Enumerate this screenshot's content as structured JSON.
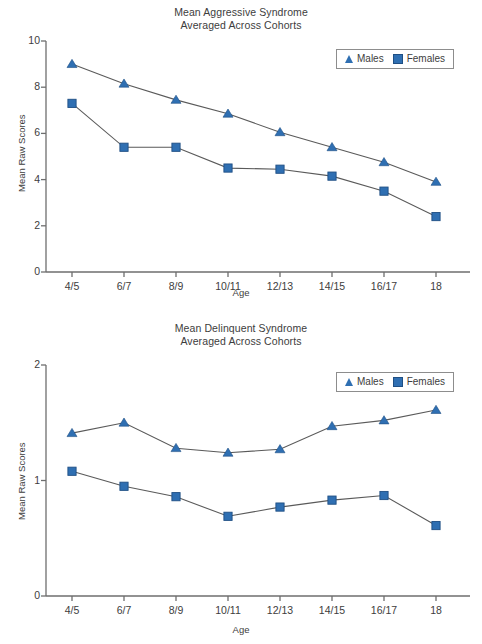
{
  "colors": {
    "series": "#2f6fb2",
    "series_edge": "#1f4f84",
    "line": "#5a5a5a",
    "axis": "#6e6e6e",
    "text": "#3d3d3d"
  },
  "legend": {
    "males_label": "Males",
    "females_label": "Females",
    "males_marker": "triangle-marker",
    "females_marker": "square-marker"
  },
  "chart_data": [
    {
      "type": "line",
      "id": "aggressive-syndrome",
      "title": "Mean Aggressive Syndrome",
      "subtitle": "Averaged Across Cohorts",
      "xlabel": "Age",
      "ylabel": "Mean Raw Scores",
      "categories": [
        "4/5",
        "6/7",
        "8/9",
        "10/11",
        "12/13",
        "14/15",
        "16/17",
        "18"
      ],
      "ylim": [
        0,
        10
      ],
      "yticks": [
        0,
        2,
        4,
        6,
        8,
        10
      ],
      "ytick_labels": [
        "0",
        "2",
        "4",
        "6",
        "8",
        "10"
      ],
      "grid": false,
      "legend_position": "top-right",
      "series": [
        {
          "name": "Males",
          "marker": "triangle",
          "values": [
            9.0,
            8.15,
            7.45,
            6.85,
            6.05,
            5.4,
            4.75,
            3.9
          ]
        },
        {
          "name": "Females",
          "marker": "square",
          "values": [
            7.3,
            5.4,
            5.4,
            4.5,
            4.45,
            4.15,
            3.5,
            2.4
          ]
        }
      ]
    },
    {
      "type": "line",
      "id": "delinquent-syndrome",
      "title": "Mean Delinquent Syndrome",
      "subtitle": "Averaged Across Cohorts",
      "xlabel": "Age",
      "ylabel": "Mean Raw Scores",
      "categories": [
        "4/5",
        "6/7",
        "8/9",
        "10/11",
        "12/13",
        "14/15",
        "16/17",
        "18"
      ],
      "ylim": [
        0,
        2
      ],
      "yticks": [
        0,
        1,
        2
      ],
      "ytick_labels": [
        "0",
        "1",
        "2"
      ],
      "grid": false,
      "legend_position": "top-right",
      "series": [
        {
          "name": "Males",
          "marker": "triangle",
          "values": [
            1.41,
            1.5,
            1.28,
            1.24,
            1.27,
            1.47,
            1.52,
            1.61
          ]
        },
        {
          "name": "Females",
          "marker": "square",
          "values": [
            1.08,
            0.95,
            0.86,
            0.69,
            0.77,
            0.83,
            0.87,
            0.61
          ]
        }
      ]
    }
  ]
}
